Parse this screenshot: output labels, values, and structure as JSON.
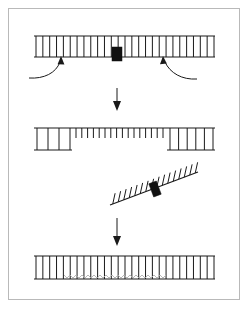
{
  "figure": {
    "background_color": "#ffffff",
    "frame_color": "#b9b9b9",
    "ink_color": "#1a1a1a",
    "wave_color": "#b0b0b0",
    "marker_color": "#111111",
    "frame": {
      "x": 8,
      "y": 8,
      "width": 232,
      "height": 292
    }
  },
  "chart_data": {
    "type": "diagram",
    "panels": [
      {
        "id": "panel-1",
        "label": "intact duplex with lesion marker and two incision sites",
        "rail_top": {
          "x1": 34,
          "x2": 215,
          "y": 36
        },
        "rail_bottom": {
          "x1": 34,
          "x2": 215,
          "y": 57
        },
        "rungs": {
          "count": 27,
          "x_start": 36,
          "x_end": 214,
          "y_top": 36,
          "y_bottom": 57
        },
        "marker": {
          "x": 112,
          "y": 47,
          "width": 10,
          "height": 14,
          "shape": "filled-rectangle"
        },
        "arrows": [
          {
            "name": "incision-arrow-left",
            "tip_x": 61,
            "tip_y": 57,
            "tail_x": 29,
            "tail_y": 78,
            "curved": true
          },
          {
            "name": "incision-arrow-right",
            "tip_x": 164,
            "tip_y": 57,
            "tail_x": 196,
            "tail_y": 79,
            "curved": true
          }
        ]
      },
      {
        "id": "transition-arrow-1",
        "label": "downward process arrow",
        "x": 117,
        "y_start": 88,
        "y_end": 110
      },
      {
        "id": "panel-2",
        "label": "gapped duplex after excision of the marked segment",
        "rail_top": {
          "x1": 34,
          "x2": 215,
          "y": 128
        },
        "rail_bottom_segments": [
          {
            "x1": 34,
            "x2": 72,
            "y": 150
          },
          {
            "x1": 167,
            "x2": 215,
            "y": 150
          }
        ],
        "full_rungs_left": {
          "count": 4,
          "x_start": 37,
          "x_end": 70,
          "y_top": 128,
          "y_bottom": 150
        },
        "short_rungs_middle": {
          "count": 16,
          "x_start": 76,
          "x_end": 163,
          "y_top": 128,
          "y_bottom": 138
        },
        "full_rungs_right": {
          "count": 6,
          "x_start": 170,
          "x_end": 213,
          "y_top": 128,
          "y_bottom": 150
        }
      },
      {
        "id": "panel-3",
        "label": "excised single-strand fragment carrying the marker",
        "rail": {
          "x1": 110,
          "y1": 205,
          "x2": 198,
          "y2": 172
        },
        "rungs": {
          "count": 16,
          "length": 11,
          "direction": "up-left-normal"
        },
        "marker": {
          "x": 151,
          "y": 183,
          "width": 8,
          "height": 13,
          "shape": "filled-rectangle",
          "rotation_deg": -21
        }
      },
      {
        "id": "transition-arrow-2",
        "label": "downward process arrow",
        "x": 117,
        "y_start": 218,
        "y_end": 245
      },
      {
        "id": "panel-4",
        "label": "resynthesized duplex with mismatched heteroduplex region",
        "rail_top": {
          "x1": 34,
          "x2": 215,
          "y": 256
        },
        "rail_bottom": {
          "x1": 34,
          "x2": 215,
          "y": 279
        },
        "rungs": {
          "count": 27,
          "x_start": 36,
          "x_end": 214,
          "y_top": 256,
          "y_bottom": 279
        },
        "wave_region": {
          "x_start": 64,
          "x_end": 168,
          "y": 278,
          "amplitude": 3,
          "period": 6,
          "color": "#b0b0b0"
        }
      }
    ]
  },
  "elements": {
    "panel1_name": "top duplex panel",
    "panel2_name": "gapped duplex panel",
    "panel3_name": "excised fragment panel",
    "panel4_name": "repaired duplex panel",
    "arrow1_name": "first transition arrow",
    "arrow2_name": "second transition arrow"
  }
}
